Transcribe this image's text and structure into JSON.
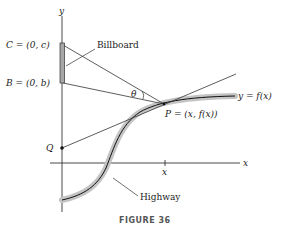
{
  "figure": {
    "caption": "FIGURE 36",
    "axes": {
      "x_label": "x",
      "y_label": "y",
      "x_tick_label": "x"
    },
    "points": {
      "C": "C = (0, c)",
      "B": "B = (0, b)",
      "P": "P = (x, f(x))",
      "Q": "Q"
    },
    "labels": {
      "billboard": "Billboard",
      "highway": "Highway",
      "curve": "y = f(x)",
      "angle": "θ"
    },
    "colors": {
      "line": "#222222",
      "highway_band": "#bfbfbf",
      "billboard_fill": "#a8a8a8"
    }
  }
}
